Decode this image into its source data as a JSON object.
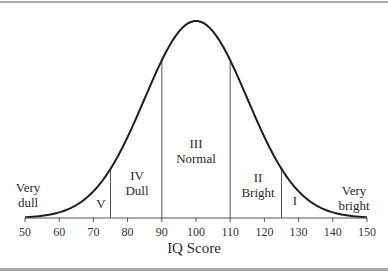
{
  "chart_data": {
    "type": "line",
    "title": "",
    "xlabel": "IQ Score",
    "ylabel": "",
    "xlim": [
      50,
      150
    ],
    "x_ticks": [
      50,
      60,
      70,
      80,
      90,
      100,
      110,
      120,
      130,
      140,
      150
    ],
    "tick_labels": [
      "50",
      "60",
      "70",
      "80",
      "90",
      "100",
      "110",
      "120",
      "130",
      "140",
      "150"
    ],
    "distribution": {
      "kind": "normal",
      "mean": 100,
      "sd": 15
    },
    "grid": false,
    "legend": null,
    "dividers": [
      75,
      90,
      110,
      125
    ],
    "regions": [
      {
        "id": "very-dull",
        "lines": [
          "Very",
          "dull"
        ],
        "range": [
          50,
          75
        ]
      },
      {
        "id": "v",
        "lines": [
          "V"
        ],
        "range": [
          65,
          75
        ]
      },
      {
        "id": "iv-dull",
        "lines": [
          "IV",
          "Dull"
        ],
        "range": [
          75,
          90
        ]
      },
      {
        "id": "iii-normal",
        "lines": [
          "III",
          "Normal"
        ],
        "range": [
          90,
          110
        ]
      },
      {
        "id": "ii-bright",
        "lines": [
          "II",
          "Bright"
        ],
        "range": [
          110,
          125
        ]
      },
      {
        "id": "i",
        "lines": [
          "I"
        ],
        "range": [
          125,
          135
        ]
      },
      {
        "id": "very-bright",
        "lines": [
          "Very",
          "bright"
        ],
        "range": [
          125,
          150
        ]
      }
    ]
  },
  "labels": {
    "very_dull_1": "Very",
    "very_dull_2": "dull",
    "v": "V",
    "iv": "IV",
    "dull": "Dull",
    "iii": "III",
    "normal": "Normal",
    "ii": "II",
    "bright": "Bright",
    "i": "I",
    "very_bright_1": "Very",
    "very_bright_2": "bright",
    "x_axis_title": "IQ Score"
  },
  "colors": {
    "curve": "#1e1e1e",
    "divider": "#555555",
    "axis": "#555555",
    "frame": "#a8a8a8"
  }
}
